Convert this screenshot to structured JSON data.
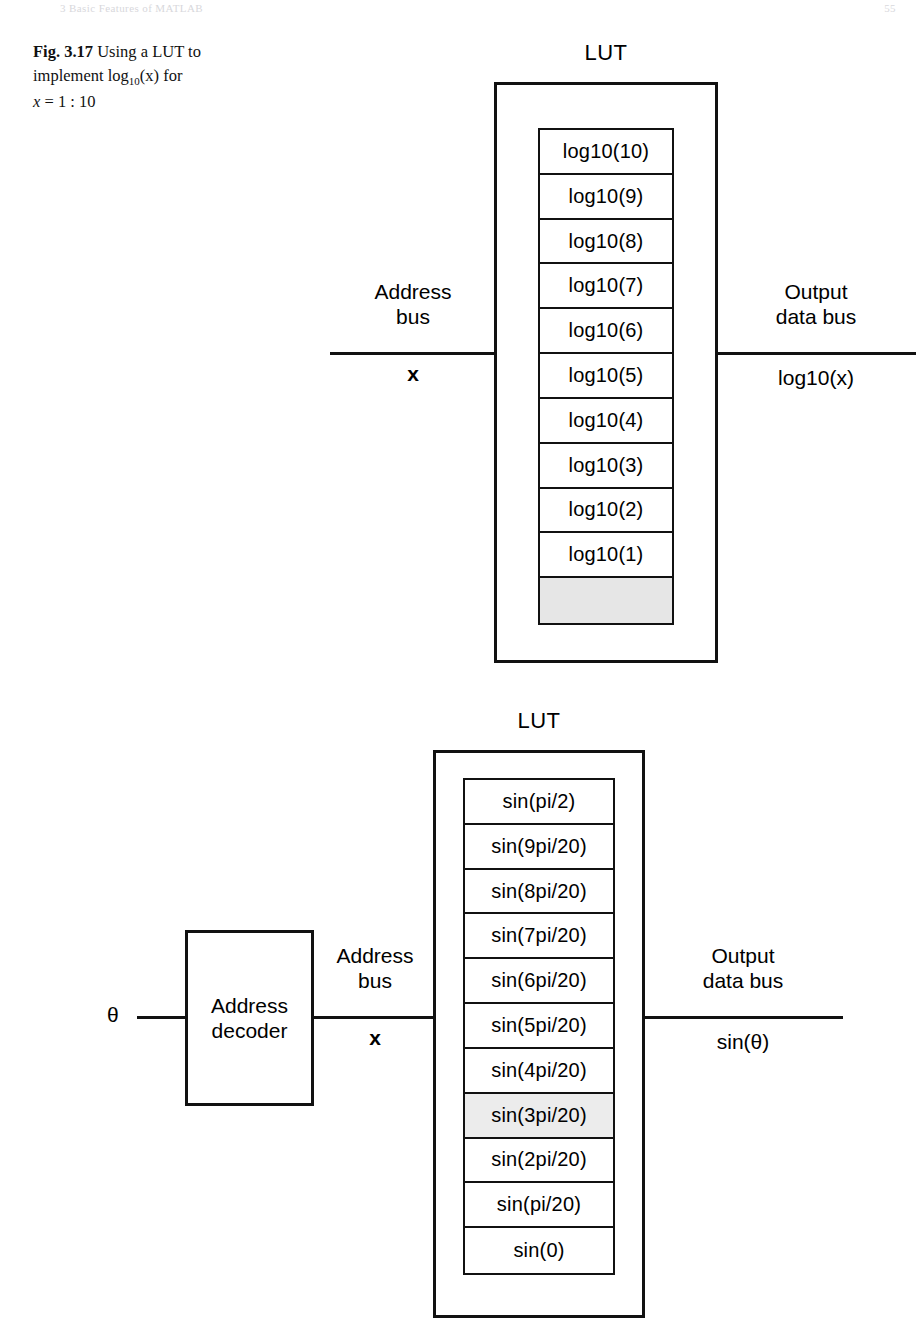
{
  "running_head": {
    "text": "3   Basic Features of MATLAB",
    "folio": "55"
  },
  "caption": {
    "label": "Fig. 3.17",
    "line1_a": "Using a LUT to",
    "line2_a": "implement log",
    "line2_sub": "10",
    "line2_b": "(x) for",
    "line3_x": "x",
    "line3_rest": "= 1 : 10"
  },
  "figure_top": {
    "lut_title": "LUT",
    "cells": [
      "log10(10)",
      "log10(9)",
      "log10(8)",
      "log10(7)",
      "log10(6)",
      "log10(5)",
      "log10(4)",
      "log10(3)",
      "log10(2)",
      "log10(1)",
      ""
    ],
    "blank_cell_index": 10,
    "input_bus_label": "Address\nbus",
    "input_bus_signal": "x",
    "output_bus_label": "Output\ndata bus",
    "output_bus_signal": "log10(x)"
  },
  "figure_bottom": {
    "lut_title": "LUT",
    "cells": [
      "sin(pi/2)",
      "sin(9pi/20)",
      "sin(8pi/20)",
      "sin(7pi/20)",
      "sin(6pi/20)",
      "sin(5pi/20)",
      "sin(4pi/20)",
      "sin(3pi/20)",
      "sin(2pi/20)",
      "sin(pi/20)",
      "sin(0)"
    ],
    "shaded_cell_index": 7,
    "input_signal": "θ",
    "decoder_line1": "Address",
    "decoder_line2": "decoder",
    "input_bus_label": "Address\nbus",
    "input_bus_signal": "x",
    "output_bus_label": "Output\ndata bus",
    "output_bus_signal": "sin(θ)"
  },
  "colors": {
    "ink": "#111111",
    "paper": "#ffffff",
    "blank_cell": "#e6e6e6",
    "shaded_cell": "#ececec"
  }
}
